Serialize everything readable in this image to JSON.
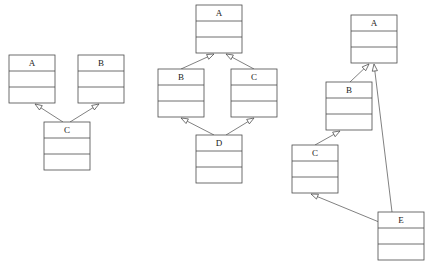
{
  "page": {
    "background_color": "#ffffff",
    "line_color": "#4a4a4a",
    "text_color": "#1a1a1a",
    "width": 430,
    "height": 266
  },
  "diagrams": [
    {
      "id": "left-diagram",
      "name": "multiple-inheritance-diagram",
      "classes": [
        {
          "id": "L-A",
          "label": "A",
          "x": 9,
          "y": 55,
          "w": 46,
          "h": 48,
          "name_h": 16,
          "row2_h": 16
        },
        {
          "id": "L-B",
          "label": "B",
          "x": 78,
          "y": 55,
          "w": 46,
          "h": 48,
          "name_h": 16,
          "row2_h": 16
        },
        {
          "id": "L-C",
          "label": "C",
          "x": 44,
          "y": 122,
          "w": 46,
          "h": 48,
          "name_h": 16,
          "row2_h": 16
        }
      ],
      "relations": [
        {
          "id": "L-C-A",
          "from": "C",
          "to": "A",
          "type": "generalization",
          "x1": 63,
          "y1": 122,
          "x2": 35,
          "y2": 104
        },
        {
          "id": "L-C-B",
          "from": "C",
          "to": "B",
          "type": "generalization",
          "x1": 70,
          "y1": 122,
          "x2": 99,
          "y2": 104
        }
      ]
    },
    {
      "id": "middle-diagram",
      "name": "diamond-inheritance-diagram",
      "classes": [
        {
          "id": "M-A",
          "label": "A",
          "x": 196,
          "y": 5,
          "w": 46,
          "h": 48,
          "name_h": 16,
          "row2_h": 16
        },
        {
          "id": "M-B",
          "label": "B",
          "x": 158,
          "y": 69,
          "w": 46,
          "h": 48,
          "name_h": 16,
          "row2_h": 16
        },
        {
          "id": "M-C",
          "label": "C",
          "x": 231,
          "y": 69,
          "w": 46,
          "h": 48,
          "name_h": 16,
          "row2_h": 16
        },
        {
          "id": "M-D",
          "label": "D",
          "x": 196,
          "y": 135,
          "w": 46,
          "h": 48,
          "name_h": 16,
          "row2_h": 16
        }
      ],
      "relations": [
        {
          "id": "M-B-A",
          "from": "B",
          "to": "A",
          "type": "generalization",
          "x1": 181,
          "y1": 69,
          "x2": 214,
          "y2": 54
        },
        {
          "id": "M-C-A",
          "from": "C",
          "to": "A",
          "type": "generalization",
          "x1": 254,
          "y1": 69,
          "x2": 226,
          "y2": 54
        },
        {
          "id": "M-D-B",
          "from": "D",
          "to": "B",
          "type": "generalization",
          "x1": 214,
          "y1": 135,
          "x2": 181,
          "y2": 118
        },
        {
          "id": "M-D-C",
          "from": "D",
          "to": "C",
          "type": "generalization",
          "x1": 226,
          "y1": 135,
          "x2": 254,
          "y2": 118
        }
      ]
    },
    {
      "id": "right-diagram",
      "name": "chained-inheritance-diagram",
      "classes": [
        {
          "id": "R-A",
          "label": "A",
          "x": 351,
          "y": 15,
          "w": 46,
          "h": 48,
          "name_h": 16,
          "row2_h": 16
        },
        {
          "id": "R-B",
          "label": "B",
          "x": 326,
          "y": 82,
          "w": 46,
          "h": 48,
          "name_h": 16,
          "row2_h": 16
        },
        {
          "id": "R-C",
          "label": "C",
          "x": 292,
          "y": 145,
          "w": 46,
          "h": 48,
          "name_h": 16,
          "row2_h": 16
        },
        {
          "id": "R-E",
          "label": "E",
          "x": 378,
          "y": 212,
          "w": 46,
          "h": 48,
          "name_h": 16,
          "row2_h": 16
        }
      ],
      "relations": [
        {
          "id": "R-B-A",
          "from": "B",
          "to": "A",
          "type": "generalization",
          "x1": 350,
          "y1": 82,
          "x2": 369,
          "y2": 64
        },
        {
          "id": "R-C-B",
          "from": "C",
          "to": "B",
          "type": "generalization",
          "x1": 315,
          "y1": 145,
          "x2": 340,
          "y2": 131
        },
        {
          "id": "R-E-C",
          "from": "E",
          "to": "C",
          "type": "generalization",
          "x1": 379,
          "y1": 222,
          "x2": 311,
          "y2": 194
        },
        {
          "id": "R-E-A",
          "from": "E",
          "to": "A",
          "type": "generalization",
          "x1": 392,
          "y1": 212,
          "x2": 374,
          "y2": 64
        }
      ]
    }
  ]
}
